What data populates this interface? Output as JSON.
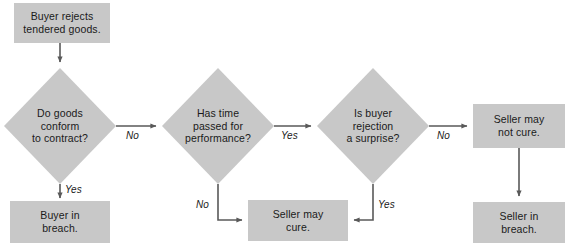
{
  "diagram": {
    "colors": {
      "node_fill": "#c8c8c8",
      "line": "#595959",
      "text": "#1a1a1a",
      "background": "#ffffff"
    },
    "nodes": [
      {
        "id": "buyer-rejects",
        "shape": "box",
        "label": "Buyer rejects\ntendered goods."
      },
      {
        "id": "goods-conform",
        "shape": "diamond",
        "label": "Do goods\nconform\nto contract?"
      },
      {
        "id": "buyer-in-breach",
        "shape": "box",
        "label": "Buyer in\nbreach."
      },
      {
        "id": "time-passed",
        "shape": "diamond",
        "label": "Has time\npassed for\nperformance?"
      },
      {
        "id": "seller-may-cure",
        "shape": "box",
        "label": "Seller may\ncure."
      },
      {
        "id": "rejection-surprise",
        "shape": "diamond",
        "label": "Is buyer\nrejection\na surprise?"
      },
      {
        "id": "seller-may-not-cure",
        "shape": "box",
        "label": "Seller may\nnot cure."
      },
      {
        "id": "seller-in-breach",
        "shape": "box",
        "label": "Seller in\nbreach."
      }
    ],
    "edges": [
      {
        "id": "rejects-to-conform",
        "from": "buyer-rejects",
        "to": "goods-conform",
        "label": ""
      },
      {
        "id": "conform-yes",
        "from": "goods-conform",
        "to": "buyer-in-breach",
        "label": "Yes"
      },
      {
        "id": "conform-no",
        "from": "goods-conform",
        "to": "time-passed",
        "label": "No"
      },
      {
        "id": "time-no",
        "from": "time-passed",
        "to": "seller-may-cure",
        "label": "No"
      },
      {
        "id": "time-yes",
        "from": "time-passed",
        "to": "rejection-surprise",
        "label": "Yes"
      },
      {
        "id": "surprise-yes",
        "from": "rejection-surprise",
        "to": "seller-may-cure",
        "label": "Yes"
      },
      {
        "id": "surprise-no",
        "from": "rejection-surprise",
        "to": "seller-may-not-cure",
        "label": "No"
      },
      {
        "id": "notcure-to-breach",
        "from": "seller-may-not-cure",
        "to": "seller-in-breach",
        "label": ""
      }
    ]
  }
}
